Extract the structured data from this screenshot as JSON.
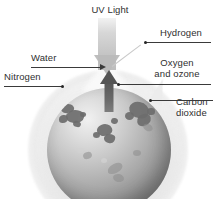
{
  "figure": {
    "background_color": "#ffffff",
    "text_color": "#2f2f2f",
    "leader_color": "#3a3a3a"
  },
  "labels": {
    "uv_light": "UV Light",
    "hydrogen": "Hydrogen",
    "water": "Water",
    "nitrogen": "Nitrogen",
    "oxygen_line1": "Oxygen",
    "oxygen_line2": "and ozone",
    "carbon_line1": "Carbon",
    "carbon_line2": "dioxide"
  },
  "diagram": {
    "planet_name": "globe",
    "planet_color": "#9a9a9a",
    "halo_color": "#e0e0e0",
    "uv_beam_color": "#bebebe",
    "outgassing_arrow_color": "#575757",
    "arrows": [
      {
        "name": "uv-light-arrow",
        "direction": "down",
        "label": "UV Light"
      },
      {
        "name": "outgassing-arrow",
        "direction": "up",
        "label": "Water"
      }
    ],
    "callouts": [
      {
        "name": "hydrogen",
        "label": "Hydrogen",
        "side": "right"
      },
      {
        "name": "oxygen-and-ozone",
        "label": "Oxygen and ozone",
        "side": "right"
      },
      {
        "name": "carbon-dioxide",
        "label": "Carbon dioxide",
        "side": "right"
      },
      {
        "name": "water",
        "label": "Water",
        "side": "left"
      },
      {
        "name": "nitrogen",
        "label": "Nitrogen",
        "side": "left"
      }
    ]
  }
}
